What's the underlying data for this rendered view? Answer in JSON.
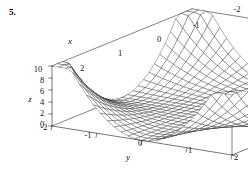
{
  "figure": {
    "problem_number": "5.",
    "background_color": "#ffffff",
    "line_color": "#1a1a1a",
    "surface_fill": "#ffffff"
  },
  "chart_data": {
    "type": "surface",
    "title": "",
    "xlabel": "x",
    "ylabel": "y",
    "zlabel": "z",
    "xlim": [
      -2,
      2
    ],
    "ylim": [
      -2,
      2
    ],
    "zlim": [
      0,
      10
    ],
    "x_ticks": [
      -2,
      -1,
      0,
      1,
      2
    ],
    "x_tick_labels": [
      "-2",
      "-1",
      "0",
      "1",
      "2"
    ],
    "y_ticks": [
      -2,
      -1,
      0,
      1,
      2
    ],
    "y_tick_labels": [
      "-2",
      "-1",
      "0",
      "1",
      "2"
    ],
    "z_ticks": [
      0,
      2,
      4,
      6,
      8,
      10
    ],
    "z_tick_labels": [
      "0",
      "2",
      "4",
      "6",
      "8",
      "10"
    ],
    "grid": false,
    "legend": null,
    "mesh_resolution": {
      "nx": 26,
      "ny": 26
    },
    "surface_expression": "z = x^2 * y^2",
    "sample_points": [
      {
        "x": -2,
        "y": -2,
        "z": 10
      },
      {
        "x": -2,
        "y": 0,
        "z": 0
      },
      {
        "x": -2,
        "y": 2,
        "z": 10
      },
      {
        "x": 0,
        "y": -2,
        "z": 0
      },
      {
        "x": 0,
        "y": 0,
        "z": 0
      },
      {
        "x": 0,
        "y": 2,
        "z": 0
      },
      {
        "x": 2,
        "y": -2,
        "z": 10
      },
      {
        "x": 2,
        "y": 0,
        "z": 0
      },
      {
        "x": 2,
        "y": 2,
        "z": 10
      },
      {
        "x": -1,
        "y": -1,
        "z": 1
      },
      {
        "x": 1,
        "y": 1,
        "z": 1
      },
      {
        "x": -2,
        "y": -1,
        "z": 4
      },
      {
        "x": -1,
        "y": -2,
        "z": 4
      }
    ],
    "axis_tick_positions": {
      "x": [
        {
          "label": "-2",
          "px": 237,
          "py": 12
        },
        {
          "label": "-1",
          "px": 196,
          "py": 28
        },
        {
          "label": "0",
          "px": 159,
          "py": 42
        },
        {
          "label": "1",
          "px": 120,
          "py": 56
        },
        {
          "label": "2",
          "px": 82,
          "py": 71
        }
      ],
      "y": [
        {
          "label": "-2",
          "px": 44,
          "py": 130
        },
        {
          "label": "-1",
          "px": 88,
          "py": 138
        },
        {
          "label": "0",
          "px": 140,
          "py": 146
        },
        {
          "label": "1",
          "px": 190,
          "py": 153
        },
        {
          "label": "2",
          "px": 236,
          "py": 160
        }
      ],
      "z": [
        {
          "label": "0",
          "px": 42,
          "py": 127
        },
        {
          "label": "2",
          "px": 42,
          "py": 116
        },
        {
          "label": "4",
          "px": 42,
          "py": 105
        },
        {
          "label": "6",
          "px": 42,
          "py": 94
        },
        {
          "label": "8",
          "px": 42,
          "py": 83
        },
        {
          "label": "10",
          "px": 38,
          "py": 72
        }
      ]
    },
    "axis_name_positions": {
      "x": {
        "px": 70,
        "py": 44
      },
      "y": {
        "px": 128,
        "py": 160
      },
      "z": {
        "px": 30,
        "py": 102
      }
    }
  }
}
